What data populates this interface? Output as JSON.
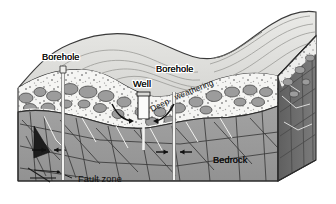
{
  "figure": {
    "type": "geologic block diagram"
  },
  "labels": {
    "borehole_left": "Borehole",
    "borehole_right": "Borehole",
    "well": "Well",
    "deep": "Deep",
    "weathering": "weathering",
    "bedrock": "Bedrock",
    "fault_zone": "Fault zone"
  },
  "colors": {
    "background": "#ffffff",
    "surface_top": "#e3e3e0",
    "surface_top_shadow": "#d2d2cf",
    "bedrock_front": "#9a9a9a",
    "bedrock_side": "#6f6f6f",
    "weathered_matrix": "#f4f4f2",
    "clast_fill": "#9d9d9d",
    "clast_dark": "#848484",
    "borehole_fill": "#f2f2f0",
    "well_fill": "#fbfbfa",
    "line": "#2b2b2b",
    "label_text": "#101010",
    "contour_line": "#8d8d8a"
  },
  "features": {
    "boreholes": 2,
    "wells": 1,
    "fault_zones": 1,
    "layers": [
      "land surface",
      "deep weathering zone",
      "fractured bedrock"
    ]
  }
}
